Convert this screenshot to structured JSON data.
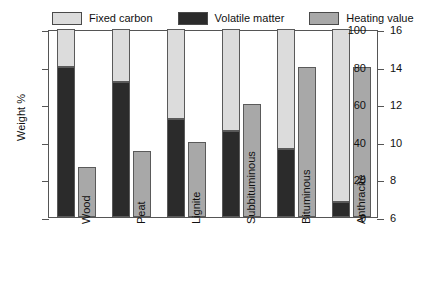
{
  "legend": {
    "items": [
      {
        "label": "Fixed carbon",
        "key": "fixed_carbon",
        "color": "#dcdcdc"
      },
      {
        "label": "Volatile matter",
        "key": "volatile_matter",
        "color": "#2b2b2b"
      },
      {
        "label": "Heating value",
        "key": "heating_value",
        "color": "#a8a8a8"
      }
    ]
  },
  "axes": {
    "left": {
      "title": "Weight %",
      "ticks": [
        0,
        20,
        40,
        60,
        80,
        100
      ],
      "min": 0,
      "max": 100
    },
    "right": {
      "title_main": "HHV (1000 Btu/lb",
      "title_sub": "m",
      "title_tail": ")",
      "ticks": [
        6,
        8,
        10,
        12,
        14,
        16
      ],
      "min": 6,
      "max": 16
    }
  },
  "chart_data": {
    "type": "bar",
    "title": "",
    "xlabel": "",
    "ylabel": "Weight %",
    "y2label": "HHV (1000 Btu/lbm)",
    "ylim": [
      0,
      100
    ],
    "y2lim": [
      6,
      16
    ],
    "grid": false,
    "legend_position": "top",
    "stacked": true,
    "categories": [
      "Wood",
      "Peat",
      "Lignite",
      "Subbituminous",
      "Bituminous",
      "Anthracite"
    ],
    "series": [
      {
        "name": "Volatile matter",
        "axis": "left",
        "unit": "%",
        "values": [
          80,
          72,
          52,
          46,
          36,
          8
        ]
      },
      {
        "name": "Fixed carbon",
        "axis": "left",
        "unit": "%",
        "values": [
          20,
          28,
          48,
          54,
          64,
          92
        ]
      },
      {
        "name": "Heating value",
        "axis": "right",
        "unit": "1000 Btu/lbm",
        "values": [
          8.6,
          9.5,
          10.0,
          12.0,
          14.0,
          14.0
        ]
      }
    ],
    "heating_value_pct_of_left_scale": [
      26.5,
      35,
      40,
      60,
      80,
      80
    ]
  },
  "colors": {
    "fixed_carbon": "#dcdcdc",
    "volatile_matter": "#2b2b2b",
    "heating_value": "#a8a8a8",
    "axis": "#555555",
    "bar_edge": "#5a5a5a",
    "text": "#111111",
    "background": "#ffffff"
  }
}
